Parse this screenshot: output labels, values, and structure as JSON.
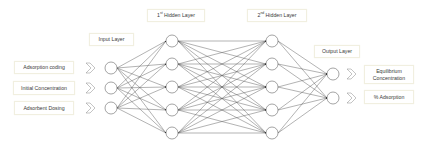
{
  "layers": {
    "input": {
      "title": "Input Layer",
      "x": 111,
      "nodes_y": [
        68,
        88,
        108
      ]
    },
    "hidden1": {
      "title_base": "1",
      "title_sup": "st",
      "title_rest": " Hidden Layer",
      "x": 172,
      "nodes_y": [
        41,
        64,
        87,
        110,
        133
      ]
    },
    "hidden2": {
      "title_base": "2",
      "title_sup": "nd",
      "title_rest": " Hidden Layer",
      "x": 272,
      "nodes_y": [
        41,
        64,
        87,
        110,
        133
      ]
    },
    "output": {
      "title": "Output Layer",
      "x": 333,
      "nodes_y": [
        74,
        98
      ]
    }
  },
  "inputs": [
    {
      "label": "Adsorption coding"
    },
    {
      "label": "Initial Concentration"
    },
    {
      "label": "Adsorbent Dosing"
    }
  ],
  "outputs": [
    {
      "label_line1": "Equilibrium",
      "label_line2": "Concentration"
    },
    {
      "label_line1": "% Adsorption",
      "label_line2": ""
    }
  ],
  "style": {
    "node_radius": 6,
    "edge_color": "#555555",
    "node_stroke": "#666666",
    "chevron_color": "#888888"
  }
}
